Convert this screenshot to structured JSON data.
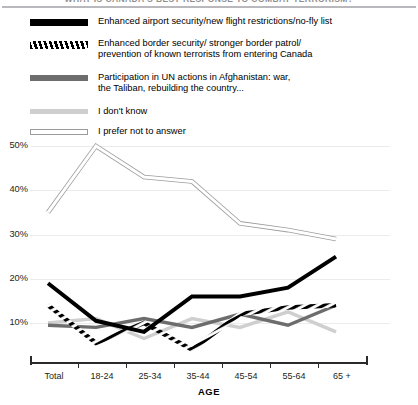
{
  "chart_data": {
    "type": "line",
    "title": "WHAT IS CANADA'S BEST RESPONSE TO COMBAT TERRORISM?",
    "xlabel": "AGE",
    "ylabel": "",
    "categories": [
      "Total",
      "18-24",
      "25-34",
      "35-44",
      "45-54",
      "55-64",
      "65 +"
    ],
    "ylim": [
      0,
      55
    ],
    "yticks": [
      10,
      20,
      30,
      40,
      50
    ],
    "ytick_labels": [
      "10%",
      "20%",
      "30%",
      "40%",
      "50%"
    ],
    "grid": true,
    "legend_position": "top",
    "series": [
      {
        "name": "Enhanced airport security/new flight restrictions/no-fly list",
        "style": "solid-black",
        "color": "#000000",
        "values": [
          19,
          10.5,
          8,
          16,
          16,
          18,
          25
        ]
      },
      {
        "name": "Enhanced border security/ stronger border patrol/\nprevention of known terrorists from entering Canada",
        "style": "hatched-black",
        "color": "#000000",
        "values": [
          14,
          5.5,
          10,
          4,
          12,
          13.5,
          14
        ]
      },
      {
        "name": "Participation in UN actions in Afghanistan: war,\nthe Taliban, rebuilding the country...",
        "style": "solid-gray",
        "color": "#6d6d6d",
        "values": [
          9.5,
          9,
          11,
          9,
          12,
          9.5,
          14
        ]
      },
      {
        "name": "I don't know",
        "style": "solid-light-gray",
        "color": "#cfcfcf",
        "values": [
          10,
          11,
          6.5,
          11,
          9,
          12.5,
          8
        ]
      },
      {
        "name": "I prefer not to answer",
        "style": "outline-white",
        "color": "#ffffff",
        "values": [
          35,
          50,
          43,
          42,
          32.5,
          31,
          29
        ]
      }
    ]
  },
  "legend": {
    "items": [
      {
        "label": "Enhanced airport security/new flight restrictions/no-fly list",
        "swatch": "solid-black-swatch"
      },
      {
        "label": "Enhanced border security/ stronger border patrol/\nprevention of known terrorists from entering Canada",
        "swatch": "hatched-black-swatch"
      },
      {
        "label": "Participation in UN actions in Afghanistan: war,\nthe Taliban, rebuilding the country...",
        "swatch": "solid-gray-swatch"
      },
      {
        "label": "I don't know",
        "swatch": "light-gray-swatch"
      },
      {
        "label": "I prefer not to answer",
        "swatch": "white-outline-swatch"
      }
    ]
  },
  "axes": {
    "y_tick_labels": [
      "50%",
      "40%",
      "30%",
      "20%",
      "10%"
    ],
    "x_tick_labels": [
      "Total",
      "18-24",
      "25-34",
      "35-44",
      "45-54",
      "55-64",
      "65 +"
    ],
    "x_axis_title": "AGE"
  }
}
